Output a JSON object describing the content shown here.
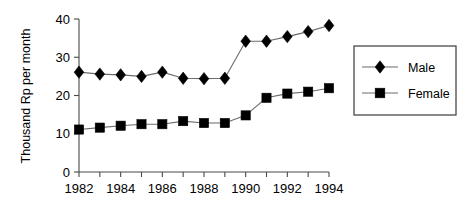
{
  "chart_data": {
    "type": "line",
    "title": "",
    "xlabel": "",
    "ylabel": "Thousand Rp per month",
    "x": [
      1982,
      1983,
      1984,
      1985,
      1986,
      1987,
      1988,
      1989,
      1990,
      1991,
      1992,
      1993,
      1994
    ],
    "xtick_labels": [
      "1982",
      "1984",
      "1986",
      "1988",
      "1990",
      "1992",
      "1994"
    ],
    "xtick_values": [
      1982,
      1984,
      1986,
      1988,
      1990,
      1992,
      1994
    ],
    "xlim": [
      1982,
      1994
    ],
    "ytick_labels": [
      "0",
      "10",
      "20",
      "30",
      "40"
    ],
    "ytick_values": [
      0,
      10,
      20,
      30,
      40
    ],
    "ylim": [
      0,
      40
    ],
    "grid": false,
    "legend_position": "right",
    "series": [
      {
        "name": "Male",
        "marker": "diamond",
        "color": "#000000",
        "values": [
          26.1,
          25.6,
          25.4,
          25.0,
          26.1,
          24.5,
          24.4,
          24.5,
          34.2,
          34.2,
          35.4,
          36.7,
          38.3
        ]
      },
      {
        "name": "Female",
        "marker": "square",
        "color": "#000000",
        "values": [
          11.1,
          11.6,
          12.1,
          12.5,
          12.5,
          13.3,
          12.8,
          12.8,
          14.8,
          19.4,
          20.5,
          21.0,
          21.9
        ]
      }
    ]
  },
  "legend": {
    "items": [
      {
        "label": "Male",
        "marker": "diamond"
      },
      {
        "label": "Female",
        "marker": "square"
      }
    ]
  },
  "axes": {
    "y_title": "Thousand Rp per month"
  }
}
